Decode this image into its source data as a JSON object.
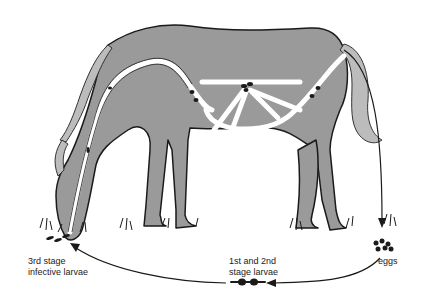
{
  "diagram": {
    "colors": {
      "body": "#9a9a9a",
      "outline": "#1a1a1a",
      "pathway": "#ffffff",
      "arrow": "#1a1a1a",
      "background": "#ffffff"
    },
    "labels": {
      "third_stage": "3rd stage\ninfective larvae",
      "first_second_stage": "1st and 2nd\nstage larvae",
      "eggs": "eggs"
    }
  }
}
